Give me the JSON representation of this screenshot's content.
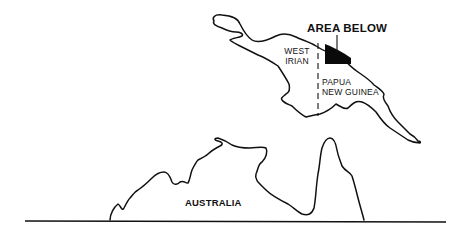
{
  "map": {
    "title_label": "AREA BELOW",
    "regions": {
      "west_irian": {
        "line1": "WEST",
        "line2": "IRIAN"
      },
      "papua_new_guinea": {
        "line1": "PAPUA",
        "line2": "NEW GUINEA"
      },
      "australia": {
        "label": "AUSTRALIA"
      }
    },
    "colors": {
      "ink": "#111111",
      "background": "#ffffff",
      "highlight_area": "#0a0a0a"
    }
  }
}
